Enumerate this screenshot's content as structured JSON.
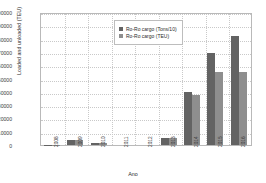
{
  "chart_data": {
    "type": "bar",
    "title": "",
    "xlabel": "Ano",
    "ylabel": "Loaded and unloaded (TEU)",
    "categories": [
      "2008",
      "2009",
      "2010",
      "2011",
      "2012",
      "2013",
      "2014",
      "2015",
      "2016"
    ],
    "series": [
      {
        "name": "Ro-Ro cargo (Tons/10)",
        "color": "#636363",
        "values": [
          300,
          4200,
          1400,
          0,
          0,
          5200,
          40500,
          70000,
          83000
        ]
      },
      {
        "name": "Ro-Ro cargo (TEU)",
        "color": "#8e8e8e",
        "values": [
          200,
          4000,
          1200,
          0,
          0,
          5000,
          38000,
          56000,
          56000
        ]
      }
    ],
    "ylim": [
      0,
      100000
    ],
    "ytick_values": [
      0,
      10000,
      20000,
      30000,
      40000,
      50000,
      60000,
      70000,
      80000,
      90000,
      100000
    ],
    "ytick_labels": [
      "0",
      "10000",
      "20000",
      "30000",
      "40000",
      "50000",
      "60000",
      "70000",
      "80000",
      "90000",
      "100000"
    ],
    "grid": true,
    "legend_position": "upper-center-inside"
  }
}
